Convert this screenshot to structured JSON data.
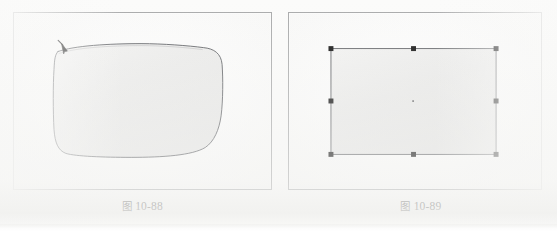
{
  "page": {
    "background_color": "#fbfbfa",
    "panel_fill_color": "#f7f7f6",
    "panel_border_color": "#a9aaab",
    "ink_color": "#4f5052",
    "handle_color": "#101010"
  },
  "figures": [
    {
      "id": "figure-10-88",
      "caption_cjk": "图",
      "caption_number": "10-88",
      "caption_full": "图 10-88",
      "panel": {
        "x": 13,
        "y": 12,
        "width": 259,
        "height": 178
      },
      "content_description": "freehand-closed-shape-with-pen-cursor",
      "shape": {
        "type": "freehand-rounded-rectangle",
        "stroke_color": "#54565a",
        "stroke_width": 1,
        "fill_color": "#efefee",
        "bounds": {
          "x": 57,
          "y": 44,
          "width": 167,
          "height": 113
        }
      },
      "cursor": {
        "name": "pen-arrow-cursor",
        "color": "#101010",
        "x": 63,
        "y": 50
      }
    },
    {
      "id": "figure-10-89",
      "caption_cjk": "图",
      "caption_number": "10-89",
      "caption_full": "图 10-89",
      "panel": {
        "x": 288,
        "y": 12,
        "width": 254,
        "height": 178
      },
      "content_description": "rectangle-with-selection-handles",
      "shape": {
        "type": "rectangle",
        "stroke_color": "#54565a",
        "stroke_width": 1,
        "fill_color": "#eeeeed",
        "bounds": {
          "x": 330,
          "y": 48,
          "width": 167,
          "height": 107
        }
      },
      "selection": {
        "handle_color": "#101010",
        "handle_size": 5,
        "handle_count": 8,
        "handles": [
          {
            "name": "handle-top-left",
            "x": 330,
            "y": 48
          },
          {
            "name": "handle-top-center",
            "x": 413,
            "y": 48
          },
          {
            "name": "handle-top-right",
            "x": 497,
            "y": 48
          },
          {
            "name": "handle-middle-left",
            "x": 330,
            "y": 101
          },
          {
            "name": "handle-middle-right",
            "x": 497,
            "y": 101
          },
          {
            "name": "handle-bottom-left",
            "x": 330,
            "y": 155
          },
          {
            "name": "handle-bottom-center",
            "x": 413,
            "y": 155
          },
          {
            "name": "handle-bottom-right",
            "x": 497,
            "y": 155
          }
        ],
        "center_point": {
          "name": "center-origin-point",
          "x": 413,
          "y": 101,
          "size": 2
        }
      }
    }
  ]
}
